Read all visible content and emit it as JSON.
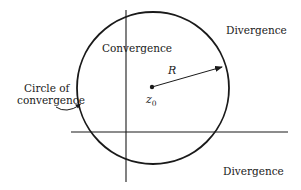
{
  "diagram": {
    "colors": {
      "ink": "#1a1a1a",
      "background": "#ffffff"
    },
    "circle": {
      "cx": 153,
      "cy": 88,
      "r": 76
    },
    "center_point": {
      "label": "z",
      "subscript": "0"
    },
    "radius_label": "R",
    "labels": {
      "inside": "Convergence",
      "outside_top_right": "Divergence",
      "outside_bottom_right": "Divergence",
      "circle_line1": "Circle of",
      "circle_line2": "convergence"
    },
    "axes": {
      "horizontal": {
        "x1": 71,
        "y": 132,
        "x2": 288
      },
      "vertical": {
        "x": 126,
        "y1": 10,
        "y2": 182
      }
    }
  }
}
